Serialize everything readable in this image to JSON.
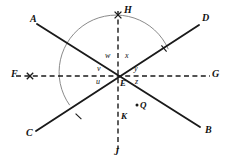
{
  "figure": {
    "type": "geometry-diagram",
    "background_color": "#ffffff",
    "stroke_color": "#1a1a1a",
    "arc_color": "#8a8a8a",
    "center_point": {
      "id": "E",
      "label": "E",
      "x": 118,
      "y": 76
    },
    "lines": [
      {
        "id": "AB",
        "name": "line-ab",
        "style": "solid",
        "endpoints": [
          {
            "label": "A",
            "x": 32,
            "y": 22
          },
          {
            "label": "B",
            "x": 204,
            "y": 130
          }
        ]
      },
      {
        "id": "CD",
        "name": "line-cd",
        "style": "solid",
        "endpoints": [
          {
            "label": "C",
            "x": 31,
            "y": 135
          },
          {
            "label": "D",
            "x": 203,
            "y": 21
          }
        ]
      },
      {
        "id": "FG",
        "name": "line-fg",
        "style": "dashed",
        "endpoints": [
          {
            "label": "F",
            "x": 12,
            "y": 76
          },
          {
            "label": "G",
            "x": 213,
            "y": 76
          }
        ]
      },
      {
        "id": "HJ",
        "name": "line-hj",
        "style": "dashed",
        "endpoints": [
          {
            "label": "H",
            "x": 118,
            "y": 10
          },
          {
            "label": "J",
            "x": 118,
            "y": 158
          }
        ]
      }
    ],
    "point_labels": [
      {
        "id": "A",
        "text": "A",
        "x": 30,
        "y": 14
      },
      {
        "id": "B",
        "text": "B",
        "x": 205,
        "y": 128
      },
      {
        "id": "C",
        "text": "C",
        "x": 26,
        "y": 130
      },
      {
        "id": "D",
        "text": "D",
        "x": 202,
        "y": 14
      },
      {
        "id": "F",
        "text": "F",
        "x": 11,
        "y": 70
      },
      {
        "id": "G",
        "text": "G",
        "x": 213,
        "y": 70
      },
      {
        "id": "H",
        "text": "H",
        "x": 124,
        "y": 5
      },
      {
        "id": "J",
        "text": "J",
        "x": 115,
        "y": 150
      },
      {
        "id": "E",
        "text": "E",
        "x": 121,
        "y": 82
      },
      {
        "id": "K",
        "text": "K",
        "x": 121,
        "y": 116
      },
      {
        "id": "Q",
        "text": "Q",
        "x": 141,
        "y": 108
      }
    ],
    "angle_labels": [
      {
        "id": "w",
        "text": "w",
        "x": 106,
        "y": 57
      },
      {
        "id": "x",
        "text": "x",
        "x": 125,
        "y": 57
      },
      {
        "id": "v",
        "text": "v",
        "x": 97,
        "y": 69
      },
      {
        "id": "y",
        "text": "y",
        "x": 135,
        "y": 69
      },
      {
        "id": "u",
        "text": "u",
        "x": 96,
        "y": 81
      },
      {
        "id": "z",
        "text": "z",
        "x": 136,
        "y": 81
      }
    ],
    "marked_points": [
      {
        "id": "Q-dot",
        "name": "point-q-dot",
        "x": 137,
        "y": 105,
        "radius": 1.4
      }
    ],
    "tick_marks": [
      {
        "id": "tick-fg-near-f",
        "name": "tick-on-line-fg",
        "cx": 30,
        "cy": 76,
        "size": 3.2
      },
      {
        "id": "tick-hj-near-h",
        "name": "tick-on-line-hj",
        "cx": 118,
        "cy": 15,
        "size": 3.4
      },
      {
        "id": "tick-arc-cd",
        "name": "tick-arc-crossing-cd",
        "cx": 78,
        "cy": 117,
        "size": 3.0
      },
      {
        "id": "tick-arc-ab",
        "name": "tick-arc-crossing-ab",
        "cx": 164,
        "cy": 49,
        "size": 3.0
      }
    ],
    "arc": {
      "id": "arc-at-E",
      "name": "angle-arc",
      "center_x": 118,
      "center_y": 76,
      "radius": 57,
      "start_angle_deg": 212,
      "end_angle_deg": 28,
      "color": "#8a8a8a"
    }
  }
}
